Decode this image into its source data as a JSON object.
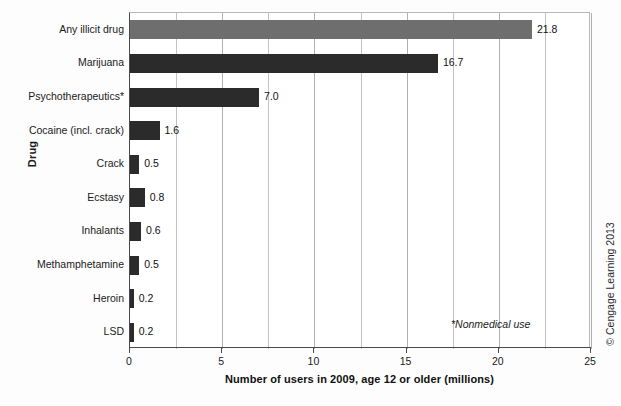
{
  "chart_data": {
    "type": "bar",
    "orientation": "horizontal",
    "title": "",
    "xlabel": "Number of users in 2009, age 12 or older (millions)",
    "ylabel": "Drug",
    "xlim": [
      0,
      25
    ],
    "xticks": [
      0,
      5,
      10,
      15,
      20,
      25
    ],
    "xtick_labels": [
      "0",
      "5",
      "10",
      "15",
      "20",
      "25"
    ],
    "gridlines_every": 2.5,
    "grid": true,
    "legend": "none",
    "categories": [
      "Any illicit drug",
      "Marijuana",
      "Psychotherapeutics*",
      "Cocaine (incl. crack)",
      "Crack",
      "Ecstasy",
      "Inhalants",
      "Methamphetamine",
      "Heroin",
      "LSD"
    ],
    "values": [
      21.8,
      16.7,
      7.0,
      1.6,
      0.5,
      0.8,
      0.6,
      0.5,
      0.2,
      0.2
    ],
    "value_labels": [
      "21.8",
      "16.7",
      "7.0",
      "1.6",
      "0.5",
      "0.8",
      "0.6",
      "0.5",
      "0.2",
      "0.2"
    ],
    "bar_colors": [
      "#6e6e6e",
      "#2b2b2b",
      "#2b2b2b",
      "#2b2b2b",
      "#2b2b2b",
      "#2b2b2b",
      "#2b2b2b",
      "#2b2b2b",
      "#2b2b2b",
      "#2b2b2b"
    ],
    "annotations": [
      {
        "text": "*Nonmedical use",
        "style": "italic"
      }
    ]
  },
  "figure": {
    "footnote": "*Nonmedical use",
    "copyright": "© Cengage Learning 2013"
  }
}
